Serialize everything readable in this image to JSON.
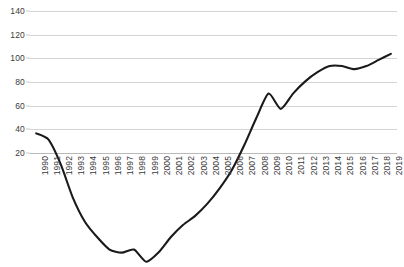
{
  "chart_data": {
    "type": "line",
    "title": "",
    "xlabel": "",
    "ylabel": "",
    "ylim": [
      20,
      140
    ],
    "ytick_step": 20,
    "yticks": [
      140,
      120,
      100,
      80,
      60,
      40,
      20
    ],
    "grid": true,
    "legend": "none",
    "line_color": "#1a1a1a",
    "grid_color": "#d4d4d4",
    "categories": [
      "1990",
      "1991",
      "1992",
      "1993",
      "1994",
      "1995",
      "1996",
      "1997",
      "1998",
      "1999",
      "2000",
      "2001",
      "2002",
      "2003",
      "2004",
      "2005",
      "2006",
      "2007",
      "2008",
      "2009",
      "2010",
      "2011",
      "2012",
      "2013",
      "2014",
      "2015",
      "2016",
      "2017",
      "2018",
      "2019"
    ],
    "values": [
      100,
      98,
      90,
      79,
      71,
      66,
      62,
      61,
      62,
      58,
      61,
      66,
      70,
      73,
      77,
      82,
      88,
      96,
      105,
      113,
      108,
      113,
      117,
      120,
      122,
      122,
      121,
      122,
      124,
      126
    ],
    "annotations": [
      "Series starts indexed at 100 in 1990",
      "Trough of about 58 in 1999",
      "Dip around 2010 following the 2009 peak",
      "Plateau near 122 across 2014-2016",
      "Ends near 126 in 2019"
    ]
  },
  "caption": {
    "text": "(clipped source note)",
    "visible": false
  }
}
